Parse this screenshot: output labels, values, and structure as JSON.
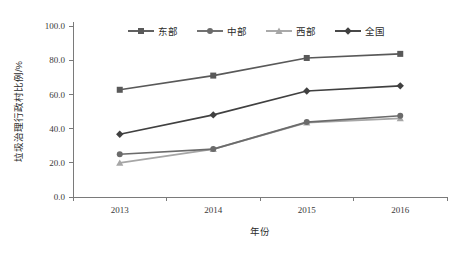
{
  "chart_data": {
    "type": "line",
    "title": "",
    "xlabel": "年份",
    "ylabel": "垃圾治理行政村比例/%",
    "categories": [
      "2013",
      "2014",
      "2015",
      "2016"
    ],
    "ylim": [
      0.0,
      100.0
    ],
    "yticks": [
      "0.0",
      "20.0",
      "40.0",
      "60.0",
      "80.0",
      "100.0"
    ],
    "ytick_values": [
      0.0,
      20.0,
      40.0,
      60.0,
      80.0,
      100.0
    ],
    "grid": false,
    "legend_position": "top-center",
    "series": [
      {
        "name": "东部",
        "values": [
          62.7,
          71.0,
          81.3,
          83.7
        ],
        "color": "#595959",
        "marker": "square"
      },
      {
        "name": "中部",
        "values": [
          25.0,
          28.0,
          43.8,
          47.5
        ],
        "color": "#6b6b6b",
        "marker": "circle"
      },
      {
        "name": "西部",
        "values": [
          20.0,
          28.0,
          43.5,
          46.0
        ],
        "color": "#a6a6a6",
        "marker": "triangle"
      },
      {
        "name": "全国",
        "values": [
          36.7,
          48.0,
          62.0,
          65.0
        ],
        "color": "#404040",
        "marker": "diamond"
      }
    ]
  },
  "colors": {
    "background": "#ffffff",
    "axis": "#7a7a7a",
    "text": "#2b2b2b",
    "east": "#595959",
    "central": "#6b6b6b",
    "west": "#a6a6a6",
    "national": "#404040"
  }
}
